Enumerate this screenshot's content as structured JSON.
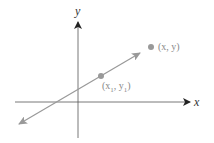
{
  "diagram": {
    "axes": {
      "x_label": "x",
      "y_label": "y"
    },
    "line": {
      "description": "line through two points with arrows at both ends"
    },
    "points": [
      {
        "id": "p1",
        "label": "(x",
        "sub": "1",
        "mid": ", y",
        "sub2": "1",
        "end": ")"
      },
      {
        "id": "p2",
        "label": "(x, y)"
      }
    ],
    "colors": {
      "axis": "#555555",
      "line": "#999999",
      "point": "#999999"
    }
  }
}
